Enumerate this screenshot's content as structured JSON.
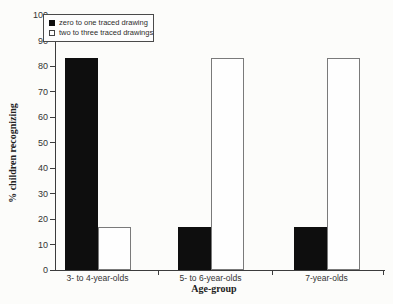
{
  "chart_data": {
    "type": "bar",
    "title": "",
    "xlabel": "Age-group",
    "ylabel": "% children recognizing",
    "ylim": [
      0,
      100
    ],
    "ytick_step": 10,
    "grid": false,
    "legend_position": "top-left",
    "categories": [
      "3- to 4-year-olds",
      "5- to 6-year-olds",
      "7-year-olds"
    ],
    "series": [
      {
        "name": "zero to one traced drawing",
        "fill": "#0e0e0e",
        "border": "#0e0e0e",
        "values": [
          83,
          17,
          17
        ]
      },
      {
        "name": "two to three traced drawings",
        "fill": "#fefefe",
        "border": "#7a7a7a",
        "values": [
          17,
          83,
          83
        ]
      }
    ]
  },
  "colors": {
    "background": "#fcfcfa",
    "axis": "#3c3c3c",
    "text": "#333333",
    "legend_border": "#4a4a4a"
  }
}
